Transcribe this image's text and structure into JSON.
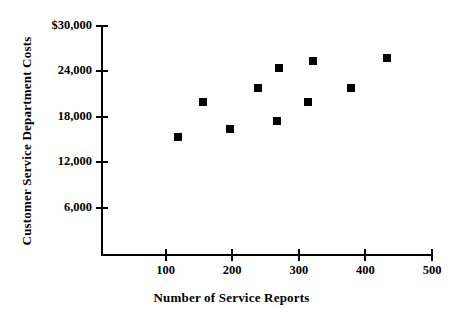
{
  "chart_data": {
    "type": "scatter",
    "title": "",
    "xlabel": "Number of Service Reports",
    "ylabel": "Customer Service Department Costs",
    "xlim": [
      0,
      500
    ],
    "ylim": [
      0,
      30000
    ],
    "grid": false,
    "legend": null,
    "x_ticks": [
      {
        "value": 100,
        "label": "100"
      },
      {
        "value": 200,
        "label": "200"
      },
      {
        "value": 300,
        "label": "300"
      },
      {
        "value": 400,
        "label": "400"
      },
      {
        "value": 500,
        "label": "500"
      }
    ],
    "y_ticks": [
      {
        "value": 30000,
        "label": "$30,000"
      },
      {
        "value": 24000,
        "label": "24,000"
      },
      {
        "value": 18000,
        "label": "18,000"
      },
      {
        "value": 12000,
        "label": "12,000"
      },
      {
        "value": 6000,
        "label": "6,000"
      }
    ],
    "marker_color": "#000000",
    "marker_shape": "square",
    "series": [
      {
        "name": "Service cost observations",
        "points": [
          {
            "x": 118,
            "y": 15300
          },
          {
            "x": 156,
            "y": 19900
          },
          {
            "x": 196,
            "y": 16400
          },
          {
            "x": 238,
            "y": 21800
          },
          {
            "x": 268,
            "y": 17500
          },
          {
            "x": 270,
            "y": 24400
          },
          {
            "x": 314,
            "y": 19900
          },
          {
            "x": 322,
            "y": 25400
          },
          {
            "x": 378,
            "y": 21800
          },
          {
            "x": 432,
            "y": 25800
          }
        ]
      }
    ]
  }
}
